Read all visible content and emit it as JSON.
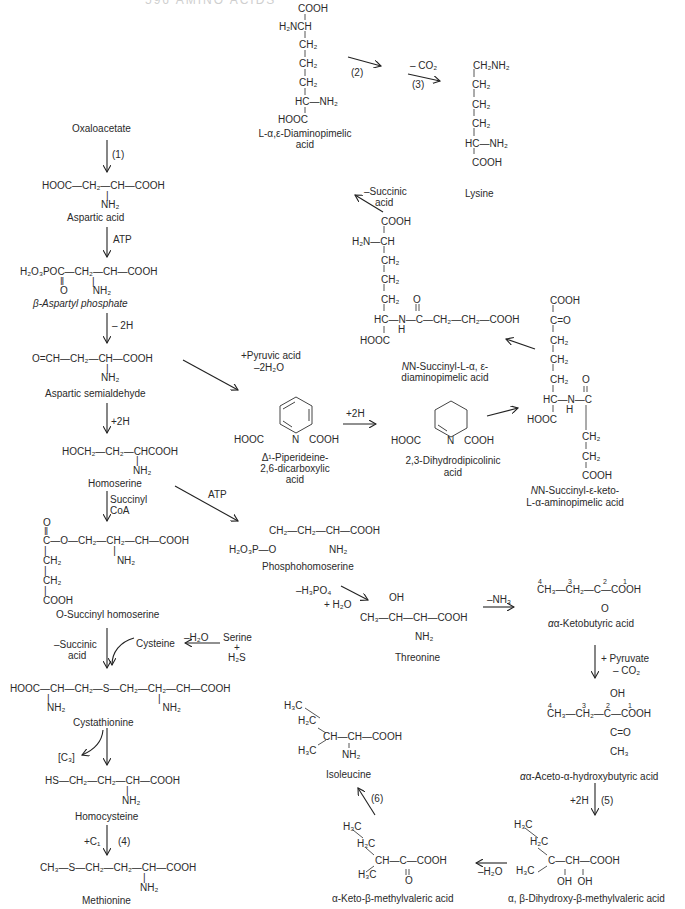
{
  "header": {
    "text": "596    AMINO ACIDS"
  },
  "compounds": {
    "oxaloacetate": {
      "name": "Oxaloacetate"
    },
    "aspartic_acid": {
      "formula": [
        "HOOC—CH₂—CH—COOH",
        "|",
        "NH₂"
      ],
      "name": "Aspartic acid"
    },
    "aspartyl_phosphate": {
      "formula": [
        "H₂O₃POC—CH₂—CH—COOH",
        "‖          |",
        "O         NH₂"
      ],
      "name": "β-Aspartyl phosphate"
    },
    "aspartic_semialdehyde": {
      "formula": [
        "O=CH—CH₂—CH—COOH",
        "|",
        "NH₂"
      ],
      "name": "Aspartic semialdehyde"
    },
    "homoserine": {
      "formula": [
        "HOCH₂—CH₂—CHCOOH",
        "|",
        "NH₂"
      ],
      "name": "Homoserine"
    },
    "o_succinyl_homoserine": {
      "formula": [
        "O",
        "‖",
        "C—O—CH₂—CH₂—CH—COOH",
        "|                        |",
        "CH₂                    NH₂",
        "|",
        "CH₂",
        "|",
        "COOH"
      ],
      "name": "O-Succinyl homoserine"
    },
    "cystathionine": {
      "formula": [
        "HOOC—CH—CH₂—S—CH₂—CH₂—CH—COOH",
        "|                                       |",
        "NH₂                                   NH₂"
      ],
      "name": "Cystathionine"
    },
    "homocysteine": {
      "formula": [
        "HS—CH₂—CH₂—CH—COOH",
        "|",
        "NH₂"
      ],
      "name": "Homocysteine"
    },
    "methionine": {
      "formula": [
        "CH₃—S—CH₂—CH₂—CH—COOH",
        "|",
        "NH₂"
      ],
      "name": "Methionine"
    },
    "diaminopimelic": {
      "formula": [
        "COOH",
        "H₂NCH",
        "CH₂",
        "CH₂",
        "CH₂",
        "HC—NH₂",
        "HOOC"
      ],
      "name": [
        "L-α,ε-Diaminopimelic",
        "acid"
      ]
    },
    "lysine": {
      "formula": [
        "CH₂NH₂",
        "CH₂",
        "CH₂",
        "CH₂",
        "HC—NH₂",
        "COOH"
      ],
      "name": "Lysine"
    },
    "n_succinyl_diaminopimelic": {
      "formula": [
        "COOH",
        "H₂N—CH",
        "CH₂",
        "CH₂",
        "CH₂",
        "HC—N—C—CH₂—CH₂—COOH",
        "HOOC",
        "H",
        "O"
      ],
      "name": [
        "N-Succinyl-L-α, ε-",
        "diaminopimelic acid"
      ]
    },
    "piperideine": {
      "left": "HOOC",
      "n": "N",
      "right": "COOH",
      "name": [
        "Δ¹-Piperideine-",
        "2,6-dicarboxylic",
        "acid"
      ]
    },
    "dihydrodipicolinic": {
      "left": "HOOC",
      "n": "N",
      "right": "COOH",
      "name": [
        "2,3-Dihydrodipicolinic",
        "acid"
      ]
    },
    "n_succinyl_keto": {
      "formula": [
        "COOH",
        "C=O",
        "CH₂",
        "CH₂",
        "CH₂",
        "HC—N—C",
        "HOOC",
        "H",
        "O",
        "CH₂",
        "CH₂",
        "COOH"
      ],
      "name": [
        "N-Succinyl-ε-keto-",
        "L-α-aminopimelic acid"
      ]
    },
    "phosphohomoserine": {
      "formula": [
        "CH₂—CH₂—CH—COOH",
        "H₂O₃P—O",
        "NH₂"
      ],
      "name": "Phosphohomoserine"
    },
    "threonine": {
      "formula": [
        "OH",
        "CH₃—CH—CH—COOH",
        "NH₂"
      ],
      "name": "Threonine"
    },
    "ketobutyric": {
      "formula": [
        "CH₃—CH₂—C—COOH",
        "O"
      ],
      "numbers": [
        "4",
        "3",
        "2",
        "1"
      ],
      "name": "α-Ketobutyric acid"
    },
    "aceto_hydroxybutyric": {
      "formula": [
        "OH",
        "CH₃—CH₂—C—COOH",
        "C=O",
        "CH₃"
      ],
      "numbers": [
        "4",
        "3",
        "2",
        "1"
      ],
      "name": "α-Aceto-α-hydroxybutyric acid"
    },
    "dihydroxy_methylvaleric": {
      "formula": [
        "H₃C",
        "H₂C",
        "C—CH—COOH",
        "H₃C",
        "OH  OH"
      ],
      "name": "α, β-Dihydroxy-β-methylvaleric acid"
    },
    "keto_methylvaleric": {
      "formula": [
        "H₃C",
        "H₂C",
        "CH—C—COOH",
        "H₃C",
        "O"
      ],
      "name": "α-Keto-β-methylvaleric acid"
    },
    "isoleucine": {
      "formula": [
        "H₃C",
        "H₂C",
        "CH—CH—COOH",
        "H₃C",
        "NH₂"
      ],
      "name": "Isoleucine"
    }
  },
  "conditions": {
    "step1": "(1)",
    "atp1": "ATP",
    "minus2h": "– 2H",
    "plus2h_a": "+2H",
    "succinyl_coa": [
      "Succinyl",
      "CoA"
    ],
    "pyruvic": [
      "+Pyruvic acid",
      "–2H₂O"
    ],
    "plus2h_b": "+2H",
    "atp2": "ATP",
    "step2": "(2)",
    "minus_co2": "– CO₂",
    "step3": "(3)",
    "minus_succinic_top": [
      "–Succinic",
      "acid"
    ],
    "minus_h3po4": [
      "–H₃PO₄",
      "+ H₂O"
    ],
    "minus_nh3": "–NH₃",
    "pyruvate_co2": [
      "+ Pyruvate",
      "– CO₂"
    ],
    "minus_succinic_left": [
      "–Succinic",
      "acid"
    ],
    "cysteine": "Cysteine",
    "minus_h2o_cys": "–H₂O",
    "serine_h2s": [
      "Serine",
      "+",
      "H₂S"
    ],
    "c3": "[C₃]",
    "plus_c1": "+C₁",
    "step4": "(4)",
    "plus2h_5": "+2H",
    "step5": "(5)",
    "minus_h2o_bottom": "–H₂O",
    "step6": "(6)"
  }
}
